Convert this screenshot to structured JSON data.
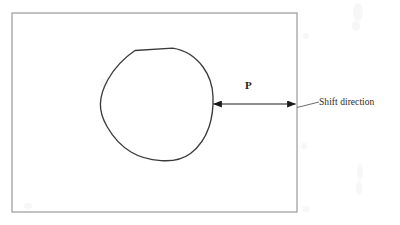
{
  "figure": {
    "type": "technical-line-diagram",
    "background_color": "#ffffff",
    "frame": {
      "name": "outer-rectangle",
      "stroke_color": "#9a9a9a",
      "stroke_width": 1.2,
      "x": 12,
      "y": 13,
      "width": 285,
      "height": 199
    },
    "blob": {
      "name": "irregular-closed-region",
      "stroke_color": "#3b3b3b",
      "stroke_width": 1.3,
      "fill": "none",
      "bounds": {
        "left": 100,
        "top": 48,
        "right": 213,
        "bottom": 161
      },
      "description": "hand-drawn rounded irregular closed outline with a flat top edge"
    },
    "arrow": {
      "name": "gap-dimension-arrow",
      "style": "double-headed",
      "stroke_color": "#1a1a1a",
      "stroke_width": 1.2,
      "y": 104,
      "x_start": 212,
      "x_end": 296
    },
    "leader_line": {
      "name": "callout-leader",
      "stroke_color": "#5a5a5a",
      "stroke_width": 0.9,
      "x_start": 297,
      "y_start": 107,
      "x_end": 319,
      "y_end": 102
    }
  },
  "labels": {
    "gap": "P",
    "shift_direction": "Shift direction"
  }
}
